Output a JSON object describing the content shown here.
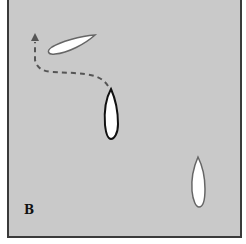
{
  "diagram": {
    "panel_label": "B",
    "colors": {
      "background": "#c9c9c9",
      "border": "#3a3a3a",
      "boat_fill": "#ffffff",
      "boat_outline_dark": "#111111",
      "boat_outline_gray": "#666666",
      "path": "#555555"
    },
    "elements": [
      {
        "id": "boat-upper-left",
        "type": "boat",
        "heading": "tilted, pointing upper-right"
      },
      {
        "id": "boat-center",
        "type": "boat",
        "heading": "pointing up"
      },
      {
        "id": "boat-lower-right",
        "type": "boat",
        "heading": "pointing up"
      },
      {
        "id": "dashed-path",
        "type": "dashed-arrow",
        "description": "from center boat bow, curving left then up with arrowhead"
      }
    ]
  }
}
